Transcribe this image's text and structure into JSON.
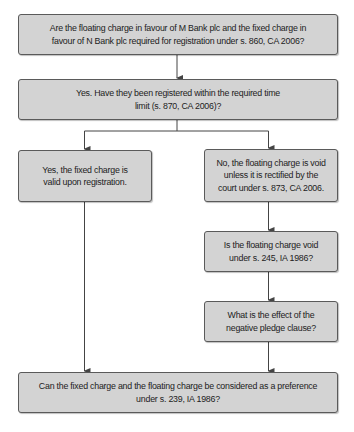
{
  "diagram": {
    "type": "flowchart",
    "colors": {
      "box_fill": "#d3d3d3",
      "box_border": "#5a5a5a",
      "connector": "#444444",
      "text": "#222222"
    },
    "nodes": {
      "q1": {
        "id": "q1",
        "text": "Are the floating charge in favour of M Bank plc and the fixed charge in favour of N Bank plc required for registration under s. 860, CA 2006?"
      },
      "q2": {
        "id": "q2",
        "text": "Yes. Have they been registered within the required time limit (s. 870, CA 2006)?"
      },
      "left_yes": {
        "id": "left_yes",
        "text": "Yes, the fixed charge is valid upon registration."
      },
      "right_no": {
        "id": "right_no",
        "text": "No, the floating charge is void unless it is rectified by the court under s. 873, CA 2006."
      },
      "q_void": {
        "id": "q_void",
        "text": "Is the floating charge void under s. 245, IA 1986?"
      },
      "q_pledge": {
        "id": "q_pledge",
        "text": "What is the effect of the negative pledge clause?"
      },
      "q_preference": {
        "id": "q_preference",
        "text": "Can the fixed charge and the floating charge be considered as a preference under s. 239, IA 1986?"
      }
    },
    "edges": [
      {
        "from": "q1",
        "to": "q2"
      },
      {
        "from": "q2",
        "to": "left_yes"
      },
      {
        "from": "q2",
        "to": "right_no"
      },
      {
        "from": "right_no",
        "to": "q_void"
      },
      {
        "from": "q_void",
        "to": "q_pledge"
      },
      {
        "from": "q_pledge",
        "to": "q_preference"
      },
      {
        "from": "left_yes",
        "to": "q_preference"
      }
    ]
  }
}
